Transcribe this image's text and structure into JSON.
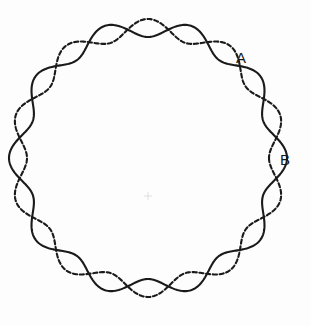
{
  "figure": {
    "background_color": "#fdfdfd",
    "stroke_color": "#1a1a1a",
    "width": 311,
    "height": 325
  },
  "labels": [
    {
      "id": "A",
      "text": "A",
      "x": 241,
      "y": 58
    },
    {
      "id": "B",
      "text": "B",
      "x": 285,
      "y": 160
    }
  ],
  "chart_data": {
    "type": "line",
    "subtitle": "",
    "xlabel": "",
    "ylabel": "",
    "coordinate_system": "polar",
    "grid": false,
    "legend_position": "none",
    "center": {
      "x": 148,
      "y": 158
    },
    "base_radius": 130,
    "lobes": 10,
    "amplitude": 9,
    "xlim": [
      0,
      311
    ],
    "ylim": [
      0,
      325
    ],
    "series": [
      {
        "name": "solid-curve",
        "style": "solid",
        "color": "#1a1a1a",
        "stroke_width": 2.1,
        "phase_degrees": 0,
        "formula": "r(t) = 130 + 9*cos(10*t)"
      },
      {
        "name": "dashed-curve",
        "style": "dashed",
        "color": "#1a1a1a",
        "stroke_width": 2.1,
        "dash_pattern": "4.2 2.6",
        "phase_degrees": 180,
        "formula": "r(t) = 130 - 9*cos(10*t)"
      }
    ],
    "annotations": [
      {
        "label": "A",
        "description": "crossing point of the two curves, upper right",
        "x": 241,
        "y": 58
      },
      {
        "label": "B",
        "description": "crossing point of the two curves, right",
        "x": 285,
        "y": 160
      }
    ]
  }
}
